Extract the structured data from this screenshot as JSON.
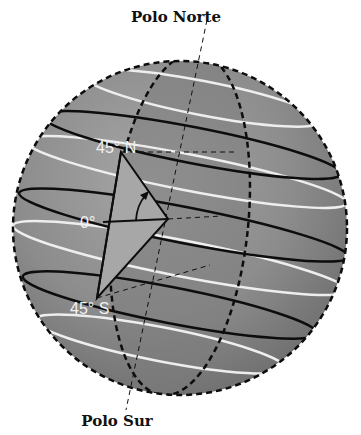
{
  "labels": {
    "north_pole": "Polo Norte",
    "south_pole": "Polo Sur",
    "lat_north": "45° N",
    "lat_equator": "0°",
    "lat_south": "45° S"
  },
  "colors": {
    "sphere_light": "#9a9a9a",
    "sphere_dark": "#6a6a6a",
    "triangle": "#a3a3a3",
    "black_lines": "#0d0d0d",
    "white_lines": "#eeeeee",
    "label_text": "#f2f2f2"
  },
  "legend": {
    "white_ellipses": "parallel circles (white)",
    "black_ellipses": "parallel circles (black)"
  }
}
